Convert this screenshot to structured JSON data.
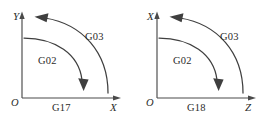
{
  "figure": {
    "background_color": "#ffffff",
    "line_color": "#3f3f3f",
    "text_color": "#2b2b2b",
    "width": 274,
    "height": 117
  },
  "panels": [
    {
      "id": "g17",
      "plane_label": "G17",
      "origin_label": "O",
      "vertical_axis_label": "Y",
      "horizontal_axis_label": "X",
      "arcs": [
        {
          "code": "G02",
          "direction": "clockwise",
          "arrow": "down",
          "position": "inner"
        },
        {
          "code": "G03",
          "direction": "counterclockwise",
          "arrow": "left",
          "position": "outer"
        }
      ]
    },
    {
      "id": "g18",
      "plane_label": "G18",
      "origin_label": "O",
      "vertical_axis_label": "X",
      "horizontal_axis_label": "Z",
      "arcs": [
        {
          "code": "G02",
          "direction": "clockwise",
          "arrow": "down",
          "position": "inner"
        },
        {
          "code": "G03",
          "direction": "counterclockwise",
          "arrow": "left",
          "position": "outer"
        }
      ]
    }
  ]
}
